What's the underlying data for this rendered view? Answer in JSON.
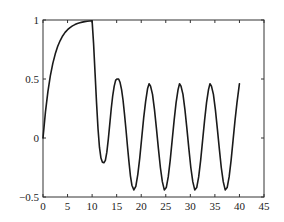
{
  "chart_data": {
    "type": "line",
    "title": "",
    "xlabel": "",
    "ylabel": "",
    "xlim": [
      0,
      45
    ],
    "ylim": [
      -0.5,
      1
    ],
    "grid": false,
    "legend": null,
    "xticks": [
      0,
      5,
      10,
      15,
      20,
      25,
      30,
      35,
      40,
      45
    ],
    "xtick_labels": [
      "0",
      "5",
      "10",
      "15",
      "20",
      "25",
      "30",
      "35",
      "40",
      "45"
    ],
    "yticks": [
      -0.5,
      0,
      0.5,
      1
    ],
    "ytick_labels": [
      "−0.5",
      "0",
      "0.5",
      "1"
    ],
    "line_color": "#1a1a1a",
    "series": [
      {
        "name": "response",
        "x": [
          0,
          0.5,
          1,
          1.5,
          2,
          2.5,
          3,
          3.5,
          4,
          4.5,
          5,
          5.5,
          6,
          6.5,
          7,
          7.5,
          8,
          8.5,
          9,
          9.5,
          10,
          10.3,
          10.6,
          10.9,
          11.2,
          11.5,
          11.8,
          12.1,
          12.4,
          12.7,
          13.0,
          13.3,
          13.6,
          13.9,
          14.2,
          14.5,
          14.8,
          15.1,
          15.4,
          15.7,
          16.0,
          16.3,
          16.6,
          16.9,
          17.2,
          17.5,
          17.8,
          18.1,
          18.5,
          18.9,
          19.3,
          19.7,
          20.1,
          20.5,
          20.9,
          21.3,
          21.6,
          21.9,
          22.3,
          22.7,
          23.1,
          23.5,
          23.9,
          24.3,
          24.7,
          25.1,
          25.5,
          25.9,
          26.3,
          26.7,
          27.1,
          27.5,
          27.8,
          28.1,
          28.5,
          28.9,
          29.3,
          29.7,
          30.1,
          30.5,
          30.9,
          31.3,
          31.7,
          32.1,
          32.5,
          32.9,
          33.3,
          33.7,
          34.0,
          34.3,
          34.7,
          35.1,
          35.5,
          35.9,
          36.3,
          36.7,
          37.1,
          37.5,
          37.9,
          38.3,
          38.7,
          39.1,
          39.5,
          40
        ],
        "y": [
          0,
          0.221,
          0.393,
          0.528,
          0.632,
          0.713,
          0.777,
          0.826,
          0.865,
          0.895,
          0.918,
          0.936,
          0.95,
          0.961,
          0.97,
          0.976,
          0.982,
          0.986,
          0.989,
          0.991,
          0.993,
          0.8,
          0.55,
          0.3,
          0.08,
          -0.08,
          -0.17,
          -0.205,
          -0.21,
          -0.19,
          -0.12,
          -0.01,
          0.12,
          0.25,
          0.36,
          0.44,
          0.49,
          0.5,
          0.5,
          0.47,
          0.41,
          0.32,
          0.2,
          0.07,
          -0.07,
          -0.2,
          -0.32,
          -0.4,
          -0.44,
          -0.41,
          -0.31,
          -0.17,
          0.0,
          0.17,
          0.31,
          0.42,
          0.46,
          0.44,
          0.37,
          0.24,
          0.08,
          -0.09,
          -0.25,
          -0.37,
          -0.44,
          -0.42,
          -0.33,
          -0.19,
          -0.02,
          0.15,
          0.3,
          0.41,
          0.46,
          0.44,
          0.37,
          0.24,
          0.08,
          -0.09,
          -0.25,
          -0.37,
          -0.44,
          -0.42,
          -0.33,
          -0.19,
          -0.02,
          0.15,
          0.3,
          0.41,
          0.46,
          0.44,
          0.37,
          0.24,
          0.08,
          -0.09,
          -0.25,
          -0.37,
          -0.44,
          -0.42,
          -0.33,
          -0.19,
          -0.02,
          0.15,
          0.3,
          0.46
        ]
      }
    ]
  }
}
